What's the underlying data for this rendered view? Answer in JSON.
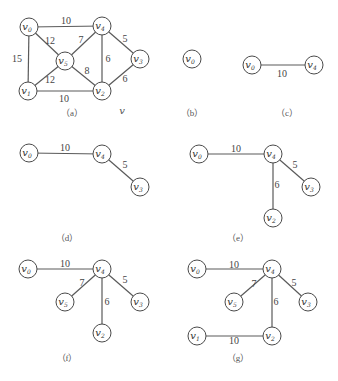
{
  "figure": {
    "extra_label": {
      "text": "v",
      "x": 122,
      "y": 114
    },
    "panels": [
      {
        "id": "a",
        "caption": "（a）",
        "caption_pos": [
          72,
          116
        ],
        "nodes": [
          {
            "id": "v0",
            "sub": "0",
            "x": 29,
            "y": 27
          },
          {
            "id": "v4",
            "sub": "4",
            "x": 102,
            "y": 26
          },
          {
            "id": "v5",
            "sub": "5",
            "x": 65,
            "y": 61
          },
          {
            "id": "v3",
            "sub": "3",
            "x": 140,
            "y": 59
          },
          {
            "id": "v1",
            "sub": "1",
            "x": 28,
            "y": 91
          },
          {
            "id": "v2",
            "sub": "2",
            "x": 102,
            "y": 91
          }
        ],
        "edges": [
          {
            "from": "v0",
            "to": "v4",
            "weight": "10",
            "lx": 66,
            "ly": 24
          },
          {
            "from": "v0",
            "to": "v5",
            "weight": "12",
            "lx": 50,
            "ly": 44
          },
          {
            "from": "v0",
            "to": "v1",
            "weight": "15",
            "lx": 17,
            "ly": 62
          },
          {
            "from": "v4",
            "to": "v5",
            "weight": "7",
            "lx": 81,
            "ly": 43
          },
          {
            "from": "v4",
            "to": "v3",
            "weight": "5",
            "lx": 125,
            "ly": 42
          },
          {
            "from": "v4",
            "to": "v2",
            "weight": "6",
            "lx": 108,
            "ly": 62
          },
          {
            "from": "v5",
            "to": "v1",
            "weight": "12",
            "lx": 50,
            "ly": 83
          },
          {
            "from": "v5",
            "to": "v2",
            "weight": "8",
            "lx": 87,
            "ly": 74
          },
          {
            "from": "v3",
            "to": "v2",
            "weight": "6",
            "lx": 125,
            "ly": 82
          },
          {
            "from": "v1",
            "to": "v2",
            "weight": "10",
            "lx": 64,
            "ly": 102
          }
        ]
      },
      {
        "id": "b",
        "caption": "（b）",
        "caption_pos": [
          192,
          116
        ],
        "nodes": [
          {
            "id": "v0",
            "sub": "0",
            "x": 192,
            "y": 59
          }
        ],
        "edges": []
      },
      {
        "id": "c",
        "caption": "（c）",
        "caption_pos": [
          287,
          116
        ],
        "nodes": [
          {
            "id": "v0",
            "sub": "0",
            "x": 252,
            "y": 65
          },
          {
            "id": "v4",
            "sub": "4",
            "x": 314,
            "y": 65
          }
        ],
        "edges": [
          {
            "from": "v0",
            "to": "v4",
            "weight": "10",
            "lx": 282,
            "ly": 77
          }
        ]
      },
      {
        "id": "d",
        "caption": "（d）",
        "caption_pos": [
          67,
          241
        ],
        "nodes": [
          {
            "id": "v0",
            "sub": "0",
            "x": 29,
            "y": 153
          },
          {
            "id": "v4",
            "sub": "4",
            "x": 102,
            "y": 154
          },
          {
            "id": "v3",
            "sub": "3",
            "x": 140,
            "y": 187
          }
        ],
        "edges": [
          {
            "from": "v0",
            "to": "v4",
            "weight": "10",
            "lx": 65,
            "ly": 151
          },
          {
            "from": "v4",
            "to": "v3",
            "weight": "5",
            "lx": 125,
            "ly": 168
          }
        ]
      },
      {
        "id": "e",
        "caption": "（e）",
        "caption_pos": [
          238,
          241
        ],
        "nodes": [
          {
            "id": "v0",
            "sub": "0",
            "x": 199,
            "y": 154
          },
          {
            "id": "v4",
            "sub": "4",
            "x": 273,
            "y": 154
          },
          {
            "id": "v3",
            "sub": "3",
            "x": 311,
            "y": 187
          },
          {
            "id": "v2",
            "sub": "2",
            "x": 273,
            "y": 218
          }
        ],
        "edges": [
          {
            "from": "v0",
            "to": "v4",
            "weight": "10",
            "lx": 236,
            "ly": 152
          },
          {
            "from": "v4",
            "to": "v3",
            "weight": "5",
            "lx": 295,
            "ly": 168
          },
          {
            "from": "v4",
            "to": "v2",
            "weight": "6",
            "lx": 277,
            "ly": 188
          }
        ]
      },
      {
        "id": "f",
        "caption": "（f）",
        "caption_pos": [
          67,
          361
        ],
        "nodes": [
          {
            "id": "v0",
            "sub": "0",
            "x": 28,
            "y": 269
          },
          {
            "id": "v4",
            "sub": "4",
            "x": 102,
            "y": 269
          },
          {
            "id": "v5",
            "sub": "5",
            "x": 65,
            "y": 302
          },
          {
            "id": "v3",
            "sub": "3",
            "x": 140,
            "y": 302
          },
          {
            "id": "v2",
            "sub": "2",
            "x": 102,
            "y": 333
          }
        ],
        "edges": [
          {
            "from": "v0",
            "to": "v4",
            "weight": "10",
            "lx": 65,
            "ly": 267
          },
          {
            "from": "v4",
            "to": "v5",
            "weight": "7",
            "lx": 82,
            "ly": 286
          },
          {
            "from": "v4",
            "to": "v2",
            "weight": "6",
            "lx": 107,
            "ly": 305
          },
          {
            "from": "v4",
            "to": "v3",
            "weight": "5",
            "lx": 125,
            "ly": 283
          }
        ]
      },
      {
        "id": "g",
        "caption": "（g）",
        "caption_pos": [
          238,
          361
        ],
        "nodes": [
          {
            "id": "v0",
            "sub": "0",
            "x": 197,
            "y": 269
          },
          {
            "id": "v4",
            "sub": "4",
            "x": 272,
            "y": 269
          },
          {
            "id": "v5",
            "sub": "5",
            "x": 234,
            "y": 302
          },
          {
            "id": "v3",
            "sub": "3",
            "x": 308,
            "y": 302
          },
          {
            "id": "v1",
            "sub": "1",
            "x": 197,
            "y": 336
          },
          {
            "id": "v2",
            "sub": "2",
            "x": 272,
            "y": 336
          }
        ],
        "edges": [
          {
            "from": "v0",
            "to": "v4",
            "weight": "10",
            "lx": 234,
            "ly": 268
          },
          {
            "from": "v4",
            "to": "v5",
            "weight": "7",
            "lx": 254,
            "ly": 287
          },
          {
            "from": "v4",
            "to": "v2",
            "weight": "6",
            "lx": 276,
            "ly": 305
          },
          {
            "from": "v4",
            "to": "v3",
            "weight": "5",
            "lx": 294,
            "ly": 286
          },
          {
            "from": "v1",
            "to": "v2",
            "weight": "10",
            "lx": 234,
            "ly": 344
          }
        ]
      }
    ]
  }
}
